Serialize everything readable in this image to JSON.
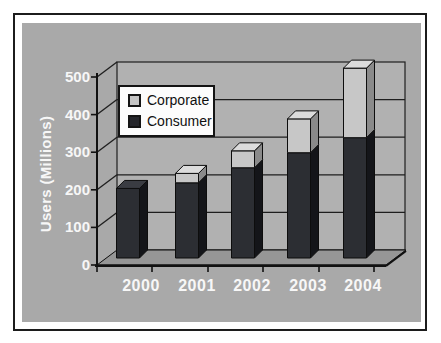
{
  "figure": {
    "outer_background": "#ffffff",
    "frame_border_color": "#1c1c1c",
    "plot_bg_color": "#a9a9a9",
    "wall_color": "#b1b1b1",
    "floor_color": "#969696",
    "axis_line_color": "#111111",
    "gridline_color": "#1e1e1e",
    "axis_text_color": "#f7f7f7"
  },
  "chart_data": {
    "type": "bar",
    "subtype": "3d-stacked-column",
    "title": "",
    "xlabel": "",
    "ylabel": "Users (Millions)",
    "categories": [
      "2000",
      "2001",
      "2002",
      "2003",
      "2004"
    ],
    "series": [
      {
        "name": "Corporate",
        "values": [
          0,
          25,
          45,
          90,
          185
        ],
        "colors": {
          "front": "#c7c7c7",
          "side": "#8a8a8a",
          "top": "#dcdcdc"
        },
        "swatch": "#c4c4c4"
      },
      {
        "name": "Consumer",
        "values": [
          185,
          200,
          240,
          280,
          320
        ],
        "colors": {
          "front": "#2c2e33",
          "side": "#141519",
          "top": "#3a3c42"
        },
        "swatch": "#25262b"
      }
    ],
    "stack_bottom_to_top": [
      "Consumer",
      "Corporate"
    ],
    "totals": [
      185,
      225,
      285,
      370,
      505
    ],
    "ylim": [
      0,
      500
    ],
    "ytick_step": 100,
    "ytick_labels_top_down": [
      "500",
      "400",
      "300",
      "200",
      "100",
      "0"
    ],
    "grid": "horizontal-back-wall",
    "legend": {
      "position": "inside-upper-left",
      "entries": [
        "Corporate",
        "Consumer"
      ]
    }
  }
}
